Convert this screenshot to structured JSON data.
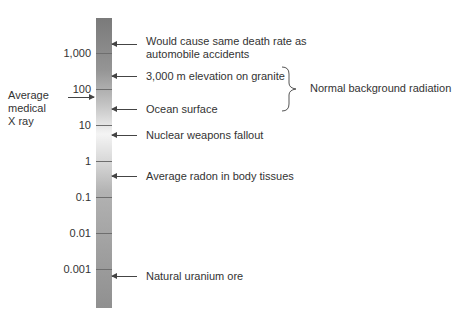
{
  "scale": {
    "tick_labels": [
      "1,000",
      "100",
      "10",
      "1",
      "0.1",
      "0.01",
      "0.001"
    ]
  },
  "annotations": [
    {
      "label_line1": "Would cause same death rate as",
      "label_line2": "automobile accidents"
    },
    {
      "label": "3,000 m elevation on granite"
    },
    {
      "label": "Ocean surface"
    },
    {
      "label": "Nuclear weapons fallout"
    },
    {
      "label": "Average radon in body tissues"
    },
    {
      "label": "Natural uranium ore"
    }
  ],
  "brace_label": "Normal background radiation",
  "left_annotation": {
    "line1": "Average",
    "line2": "medical",
    "line3": "X ray"
  }
}
